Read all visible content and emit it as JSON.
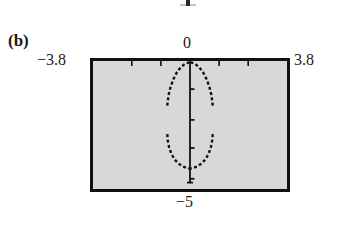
{
  "figure": {
    "panel_label": "(b)",
    "top_remnant_note": "clipped bottom of glyph from figure above"
  },
  "axes": {
    "x_min_label": "−3.8",
    "x_max_label": "3.8",
    "y_max_label": "0",
    "y_min_label": "−5"
  },
  "chart_data": {
    "type": "line",
    "title": "(b)",
    "xlabel": "",
    "ylabel": "",
    "xlim": [
      -3.8,
      3.8
    ],
    "ylim": [
      -5,
      0
    ],
    "grid": false,
    "legend": null,
    "background_color": "#d8d8d8",
    "frame_color": "#101010",
    "curve_color": "#101010",
    "x_ticks": [
      -2.28,
      -1.14,
      0,
      1.14,
      2.28
    ],
    "y_ticks": [
      -1.1,
      -2.3,
      -3.4,
      -4.6
    ],
    "tick_side": "inside",
    "axis_lines": [
      {
        "name": "y-axis",
        "x": 0.0,
        "y_from": 0.0,
        "y_to": -4.75
      }
    ],
    "series": [
      {
        "name": "closed-loop-upper-arc",
        "style": "dotted",
        "x": [
          -0.02,
          -0.18,
          -0.36,
          -0.53,
          -0.66,
          -0.76,
          -0.83,
          -0.87,
          -0.89
        ],
        "y": [
          -0.05,
          -0.1,
          -0.24,
          -0.47,
          -0.73,
          -1.01,
          -1.29,
          -1.55,
          -1.74
        ]
      },
      {
        "name": "closed-loop-upper-arc-right",
        "style": "dotted",
        "x": [
          0.02,
          0.18,
          0.36,
          0.53,
          0.66,
          0.76,
          0.83,
          0.87,
          0.89
        ],
        "y": [
          -0.05,
          -0.1,
          -0.24,
          -0.47,
          -0.73,
          -1.01,
          -1.29,
          -1.55,
          -1.74
        ]
      },
      {
        "name": "closed-loop-lower-arc-left",
        "style": "dotted",
        "x": [
          -0.89,
          -0.87,
          -0.82,
          -0.74,
          -0.62,
          -0.46,
          -0.28,
          -0.1,
          -0.02
        ],
        "y": [
          -2.86,
          -3.1,
          -3.36,
          -3.6,
          -3.82,
          -4.0,
          -4.12,
          -4.18,
          -4.2
        ]
      },
      {
        "name": "closed-loop-lower-arc-right",
        "style": "dotted",
        "x": [
          0.89,
          0.87,
          0.82,
          0.74,
          0.62,
          0.46,
          0.28,
          0.1,
          0.02
        ],
        "y": [
          -2.86,
          -3.1,
          -3.36,
          -3.6,
          -3.82,
          -4.0,
          -4.12,
          -4.18,
          -4.2
        ]
      }
    ]
  }
}
